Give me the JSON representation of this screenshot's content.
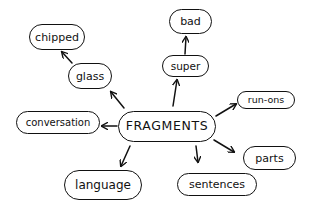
{
  "diagram": {
    "type": "mind-map",
    "style": "hand-drawn",
    "center": {
      "id": "fragments",
      "label": "FRAGMENTS"
    },
    "nodes": {
      "chipped": {
        "label": "chipped"
      },
      "glass": {
        "label": "glass"
      },
      "bad": {
        "label": "bad"
      },
      "super": {
        "label": "super"
      },
      "runons": {
        "label": "run-ons"
      },
      "conversation": {
        "label": "conversation"
      },
      "parts": {
        "label": "parts"
      },
      "language": {
        "label": "language"
      },
      "sentences": {
        "label": "sentences"
      }
    },
    "edges": [
      {
        "from": "FRAGMENTS",
        "to": "glass"
      },
      {
        "from": "glass",
        "to": "chipped"
      },
      {
        "from": "FRAGMENTS",
        "to": "super"
      },
      {
        "from": "super",
        "to": "bad"
      },
      {
        "from": "FRAGMENTS",
        "to": "run-ons"
      },
      {
        "from": "FRAGMENTS",
        "to": "conversation"
      },
      {
        "from": "FRAGMENTS",
        "to": "parts"
      },
      {
        "from": "FRAGMENTS",
        "to": "language"
      },
      {
        "from": "FRAGMENTS",
        "to": "sentences"
      }
    ],
    "colors": {
      "ink": "#111111",
      "background": "#ffffff"
    }
  }
}
